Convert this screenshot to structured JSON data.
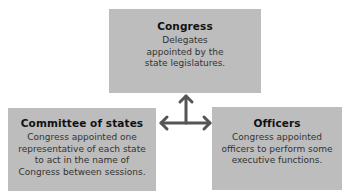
{
  "diagram": {
    "nodes": [
      {
        "id": "congress",
        "title": "Congress",
        "description": "Delegates appointed by the state legislatures."
      },
      {
        "id": "committee",
        "title": "Committee of states",
        "description": "Congress appointed one representative of each state to act in the name of Congress between sessions."
      },
      {
        "id": "officers",
        "title": "Officers",
        "description": "Congress appointed officers to perform some executive functions."
      }
    ],
    "edges": [
      {
        "from": "congress",
        "to": "committee",
        "bidirectional": true
      },
      {
        "from": "congress",
        "to": "officers",
        "bidirectional": true
      }
    ],
    "colors": {
      "box_fill": "#bdbdbd",
      "arrow": "#555555",
      "title_text": "#111111",
      "body_text": "#333333"
    }
  }
}
